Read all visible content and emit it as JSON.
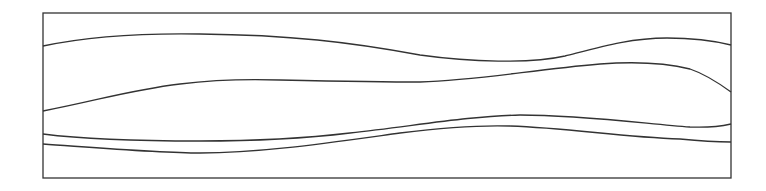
{
  "diagram": {
    "type": "line-drawing",
    "background": "#ffffff",
    "stroke_color": "#333333",
    "frame": {
      "x": 43,
      "y": 13,
      "width": 688,
      "height": 165
    },
    "curves": [
      {
        "name": "curve-1",
        "d": "M43,46 C90,36 140,33 200,34 C290,35 350,42 420,55 C470,62 530,64 565,56 C600,47 630,38 667,38 C695,38 715,41 731,45"
      },
      {
        "name": "curve-2",
        "d": "M43,111 C100,100 130,90 180,84 C220,79 250,79 280,80 C330,81 380,82 420,82 C480,80 530,70 600,64 C640,61 670,64 690,69 C705,74 720,84 731,92"
      },
      {
        "name": "curve-3",
        "d": "M43,134 C90,140 160,141 200,141 C260,141 300,139 350,133 C420,125 470,116 520,115 C580,115 640,123 690,127 C712,128 722,126 731,124"
      },
      {
        "name": "curve-4",
        "d": "M43,144 C100,148 160,153 200,153 C260,153 320,144 400,133 C440,128 480,125 510,126 C570,128 620,137 680,139 C700,141 715,142 731,142"
      }
    ]
  }
}
